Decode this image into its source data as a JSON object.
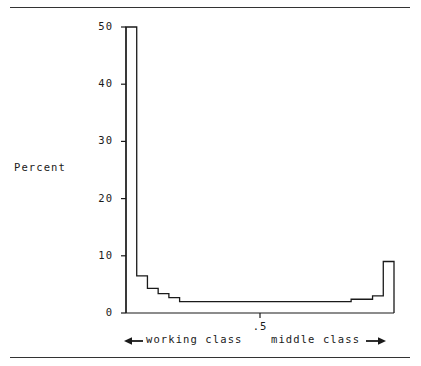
{
  "figure": {
    "background": "#ffffff",
    "ink": "#1a1a1a",
    "top_rule": "horizontal-rule",
    "bottom_rule": "horizontal-rule"
  },
  "axis": {
    "y_title": "Percent",
    "y_ticks": [
      "0",
      "10",
      "20",
      "30",
      "40",
      "50"
    ],
    "x_ticks": [
      ".5"
    ]
  },
  "annotations": {
    "left_arrow_icon": "arrow-left-icon",
    "left_label": "working class",
    "right_label": "middle class",
    "right_arrow_icon": "arrow-right-icon"
  },
  "chart_data": {
    "type": "bar",
    "title": "",
    "xlabel": "",
    "ylabel": "Percent",
    "xlim": [
      0.0,
      1.0
    ],
    "ylim": [
      0,
      50
    ],
    "grid": false,
    "legend": null,
    "style": "histogram-step-outline",
    "x_tick_values": [
      0.5
    ],
    "y_tick_values": [
      0,
      10,
      20,
      30,
      40,
      50
    ],
    "bin_edges": [
      0.0,
      0.04,
      0.08,
      0.12,
      0.16,
      0.2,
      0.24,
      0.28,
      0.32,
      0.36,
      0.4,
      0.44,
      0.48,
      0.52,
      0.56,
      0.6,
      0.64,
      0.68,
      0.72,
      0.76,
      0.8,
      0.84,
      0.88,
      0.92,
      0.96,
      1.0
    ],
    "categories": [
      "0.00-0.04",
      "0.04-0.08",
      "0.08-0.12",
      "0.12-0.16",
      "0.16-0.20",
      "0.20-0.24",
      "0.24-0.28",
      "0.28-0.32",
      "0.32-0.36",
      "0.36-0.40",
      "0.40-0.44",
      "0.44-0.48",
      "0.48-0.52",
      "0.52-0.56",
      "0.56-0.60",
      "0.60-0.64",
      "0.64-0.68",
      "0.68-0.72",
      "0.72-0.76",
      "0.76-0.80",
      "0.80-0.84",
      "0.84-0.88",
      "0.88-0.92",
      "0.92-0.96",
      "0.96-1.00"
    ],
    "values": [
      50.0,
      6.5,
      4.3,
      3.4,
      2.7,
      2.0,
      2.0,
      2.0,
      2.0,
      2.0,
      2.0,
      2.0,
      2.0,
      2.0,
      2.0,
      2.0,
      2.0,
      2.0,
      2.0,
      2.0,
      2.0,
      2.4,
      2.4,
      3.0,
      9.0
    ]
  }
}
